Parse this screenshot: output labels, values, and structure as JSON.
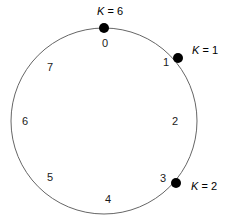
{
  "diagram": {
    "circle": {
      "center_x": 104,
      "center_y": 121,
      "radius": 93,
      "stroke_color": "#666666",
      "stroke_width": 1,
      "fill": "none"
    },
    "position_labels": [
      {
        "text": "0",
        "x": 105,
        "y": 43
      },
      {
        "text": "1",
        "x": 166,
        "y": 62
      },
      {
        "text": "2",
        "x": 175,
        "y": 121
      },
      {
        "text": "3",
        "x": 163,
        "y": 178
      },
      {
        "text": "4",
        "x": 108,
        "y": 199
      },
      {
        "text": "5",
        "x": 50,
        "y": 177
      },
      {
        "text": "6",
        "x": 25,
        "y": 121
      },
      {
        "text": "7",
        "x": 50,
        "y": 67
      }
    ],
    "nodes": [
      {
        "name": "node-k6",
        "key_var": "K",
        "key_eq": " = 6",
        "dot_x": 104,
        "dot_y": 28,
        "dot_r": 5,
        "dot_color": "#000000",
        "label_x": 110,
        "label_y": 11
      },
      {
        "name": "node-k1",
        "key_var": "K",
        "key_eq": " = 1",
        "dot_x": 178,
        "dot_y": 58,
        "dot_r": 5,
        "dot_color": "#000000",
        "label_x": 205,
        "label_y": 50
      },
      {
        "name": "node-k2",
        "key_var": "K",
        "key_eq": " = 2",
        "dot_x": 176,
        "dot_y": 183,
        "dot_r": 5,
        "dot_color": "#000000",
        "label_x": 204,
        "label_y": 186
      }
    ]
  }
}
